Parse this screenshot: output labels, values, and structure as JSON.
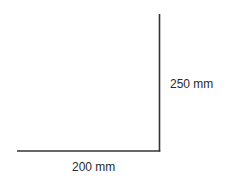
{
  "diagram": {
    "type": "right-angle dimension sketch",
    "line_color": "#333333",
    "horizontal_edge": {
      "label": "200 mm",
      "x1": 17,
      "y1": 151,
      "x2": 160,
      "y2": 151
    },
    "vertical_edge": {
      "label": "250 mm",
      "x1": 159.5,
      "y1": 14,
      "x2": 159.5,
      "y2": 151
    }
  }
}
